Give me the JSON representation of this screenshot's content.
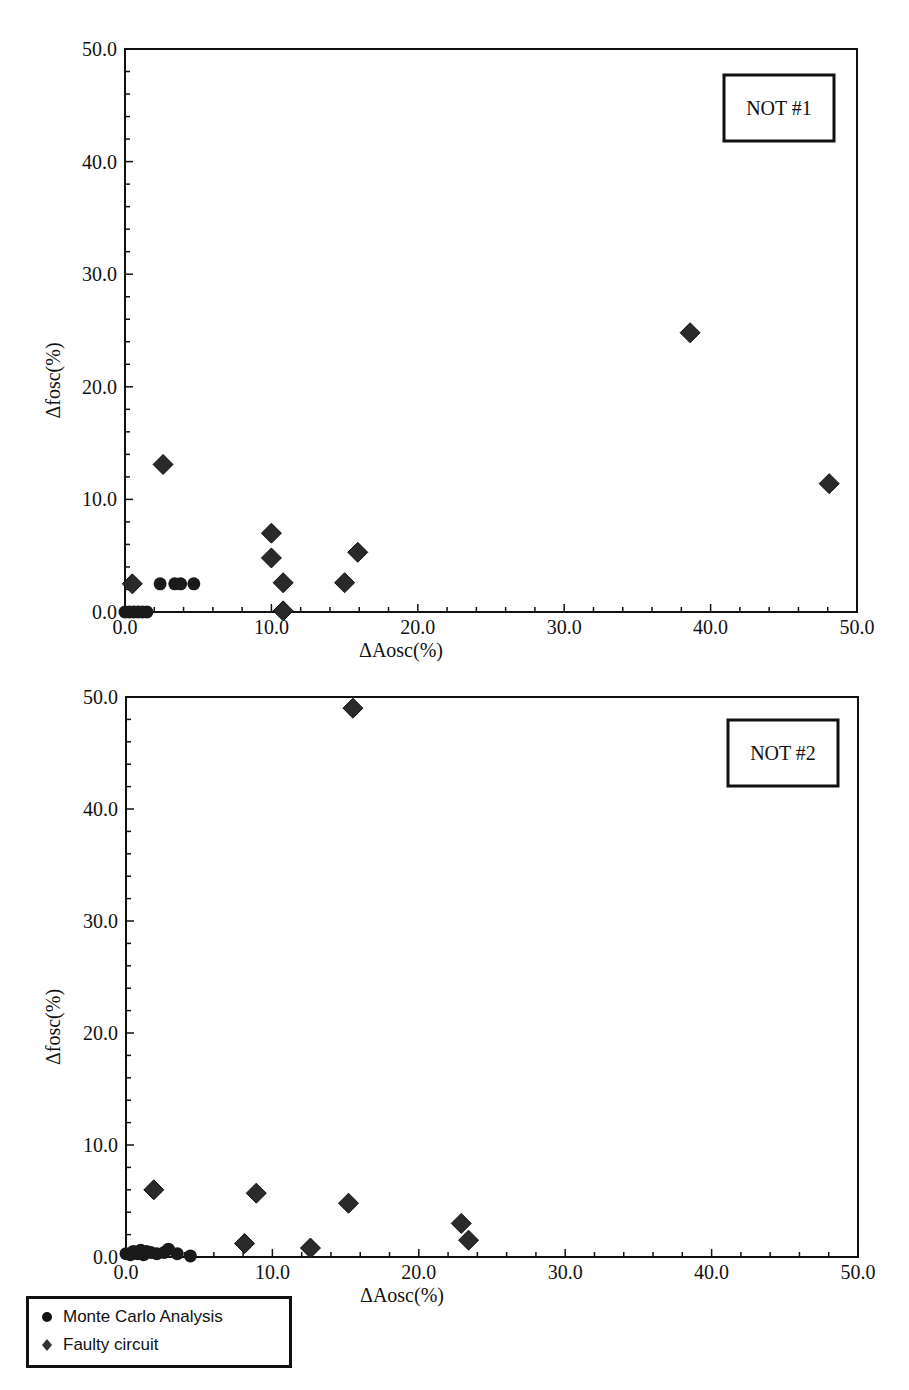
{
  "chart_data": [
    {
      "type": "scatter",
      "title": "NOT #1",
      "xlabel": "ΔAosc(%)",
      "ylabel": "Δfosc(%)",
      "xlim": [
        0,
        50
      ],
      "ylim": [
        0,
        50
      ],
      "xticks": [
        "0.0",
        "10.0",
        "20.0",
        "30.0",
        "40.0",
        "50.0"
      ],
      "yticks": [
        "0.0",
        "10.0",
        "20.0",
        "30.0",
        "40.0",
        "50.0"
      ],
      "grid": false,
      "series": [
        {
          "name": "Monte Carlo Analysis",
          "marker": "circle",
          "points": [
            [
              0.0,
              0.0
            ],
            [
              0.3,
              0.0
            ],
            [
              0.6,
              0.0
            ],
            [
              0.9,
              0.0
            ],
            [
              1.2,
              0.0
            ],
            [
              1.5,
              0.0
            ],
            [
              2.4,
              2.5
            ],
            [
              3.4,
              2.5
            ],
            [
              3.8,
              2.5
            ],
            [
              4.7,
              2.5
            ]
          ]
        },
        {
          "name": "Faulty circuit",
          "marker": "diamond",
          "points": [
            [
              0.5,
              2.5
            ],
            [
              2.6,
              13.1
            ],
            [
              10.0,
              7.0
            ],
            [
              10.0,
              4.8
            ],
            [
              10.8,
              2.6
            ],
            [
              10.8,
              0.1
            ],
            [
              15.0,
              2.6
            ],
            [
              15.9,
              5.3
            ],
            [
              38.6,
              24.8
            ],
            [
              48.1,
              11.4
            ]
          ]
        }
      ]
    },
    {
      "type": "scatter",
      "title": "NOT #2",
      "xlabel": "ΔAosc(%)",
      "ylabel": "Δfosc(%)",
      "xlim": [
        0,
        50
      ],
      "ylim": [
        0,
        50
      ],
      "xticks": [
        "0.0",
        "10.0",
        "20.0",
        "30.0",
        "40.0",
        "50.0"
      ],
      "yticks": [
        "0.0",
        "10.0",
        "20.0",
        "30.0",
        "40.0",
        "50.0"
      ],
      "grid": false,
      "series": [
        {
          "name": "Monte Carlo Analysis",
          "marker": "circle",
          "points": [
            [
              0.0,
              0.3
            ],
            [
              0.3,
              0.2
            ],
            [
              0.5,
              0.5
            ],
            [
              0.8,
              0.3
            ],
            [
              1.0,
              0.6
            ],
            [
              1.2,
              0.2
            ],
            [
              1.4,
              0.5
            ],
            [
              1.7,
              0.4
            ],
            [
              2.1,
              0.3
            ],
            [
              2.6,
              0.4
            ],
            [
              2.9,
              0.7
            ],
            [
              3.5,
              0.3
            ],
            [
              4.4,
              0.1
            ]
          ]
        },
        {
          "name": "Faulty circuit",
          "marker": "diamond",
          "points": [
            [
              15.5,
              49.0
            ],
            [
              1.9,
              6.0
            ],
            [
              8.9,
              5.7
            ],
            [
              8.1,
              1.2
            ],
            [
              12.6,
              0.8
            ],
            [
              15.2,
              4.8
            ],
            [
              22.9,
              3.0
            ],
            [
              23.4,
              1.5
            ]
          ]
        }
      ]
    }
  ],
  "legend": {
    "items": [
      {
        "label": "Monte Carlo Analysis",
        "marker": "circle"
      },
      {
        "label": "Faulty circuit",
        "marker": "diamond"
      }
    ]
  },
  "colors": {
    "marker_fill": "#1a1a1a",
    "axis": "#111111",
    "background": "#ffffff"
  }
}
